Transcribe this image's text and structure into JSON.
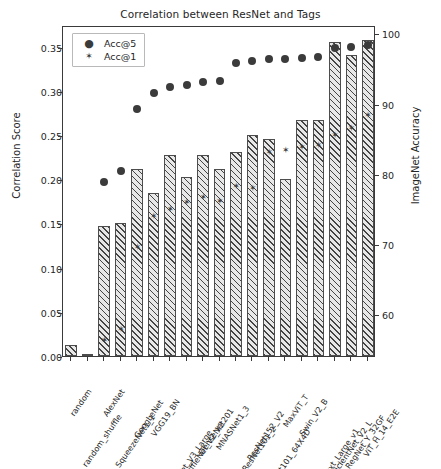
{
  "chart": {
    "title": "Correlation between ResNet and Tags",
    "ylabel": "Correlation Score",
    "y2label": "ImageNet Accuracy",
    "legend": [
      {
        "label": "Acc@5",
        "marker": "circle-marker",
        "glyph": "●"
      },
      {
        "label": "Acc@1",
        "marker": "star-marker",
        "glyph": "✶"
      }
    ],
    "yticks": [
      "0.00",
      "0.05",
      "0.10",
      "0.15",
      "0.20",
      "0.25",
      "0.30",
      "0.35"
    ],
    "y2ticks": [
      "60",
      "70",
      "80",
      "90",
      "100"
    ]
  },
  "chart_data": {
    "type": "bar",
    "title": "Correlation between ResNet and Tags",
    "xlabel": "",
    "ylabel": "Correlation Score",
    "y2label": "ImageNet Accuracy",
    "ylim": [
      0.0,
      0.3745
    ],
    "y2lim": [
      54.0,
      101.2
    ],
    "grid": false,
    "legend_position": "upper left",
    "categories": [
      "random",
      "random_shuffle",
      "AlexNet",
      "SqueezeNet1_1",
      "GoogLeNet",
      "VGG19_BN",
      "MobileNet_V3_Large",
      "ShuffleNet_V2_X2",
      "DenseNet201",
      "MNASNet1_3",
      "Wide_ResNet101_2",
      "ResNet152_V2",
      "ResNeXt101_64X4D",
      "MaxViT_T",
      "Swin_V2_B",
      "ConvNext_Large_v1",
      "EfficientNet_V2_L",
      "RegNet_Y_32GF",
      "ViT_H_14_E2E"
    ],
    "series": [
      {
        "name": "Correlation Score",
        "type": "bar",
        "axis": "left",
        "values": [
          0.012,
          0.001,
          0.147,
          0.15,
          0.212,
          0.184,
          0.227,
          0.203,
          0.227,
          0.212,
          0.231,
          0.25,
          0.245,
          0.2,
          0.267,
          0.267,
          0.355,
          0.341,
          0.358
        ]
      },
      {
        "name": "Acc@5",
        "type": "scatter",
        "axis": "right",
        "marker": "circle",
        "values": [
          null,
          null,
          79.1,
          80.6,
          89.5,
          91.8,
          92.6,
          93.0,
          93.4,
          93.5,
          96.1,
          96.3,
          96.6,
          96.7,
          96.8,
          96.9,
          98.2,
          98.4,
          98.6
        ]
      },
      {
        "name": "Acc@1",
        "type": "scatter",
        "axis": "right",
        "marker": "star",
        "values": [
          null,
          null,
          56.5,
          58.2,
          69.8,
          74.2,
          75.3,
          76.2,
          76.9,
          76.4,
          78.5,
          78.3,
          83.4,
          83.7,
          84.1,
          84.4,
          85.8,
          86.8,
          88.6
        ]
      }
    ]
  }
}
